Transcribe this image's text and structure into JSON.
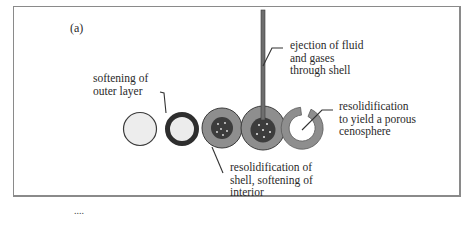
{
  "figure": {
    "panel_label": "(a)",
    "stages": [
      {
        "id": "stage-1",
        "description": "intact particle"
      },
      {
        "id": "stage-2",
        "description": "softened outer layer (dark ring)"
      },
      {
        "id": "stage-3",
        "description": "shell with softened interior core"
      },
      {
        "id": "stage-4",
        "description": "gases ejected through shell via tube"
      },
      {
        "id": "stage-5",
        "description": "porous cenosphere (open ring)"
      }
    ],
    "annotations": {
      "softening_outer": [
        "softening of",
        "outer layer"
      ],
      "ejection": [
        "ejection of fluid",
        "and gases",
        "through shell"
      ],
      "resolidification_porous": [
        "resolidification",
        "to yield a porous",
        "cenosphere"
      ],
      "resolidification_shell": [
        "resolidification of",
        "shell, softening of",
        "interior"
      ]
    },
    "footer_ellipsis": "....",
    "colors": {
      "frame": "#8a8a8a",
      "outline": "#3a3a3a",
      "pale_fill": "#ededed",
      "shell_grey": "#8e8e8e",
      "dark_core": "#3c3c3c",
      "dark_ring": "#2e2e2e",
      "dot": "#e8e8e8",
      "leader": "#333333"
    }
  }
}
